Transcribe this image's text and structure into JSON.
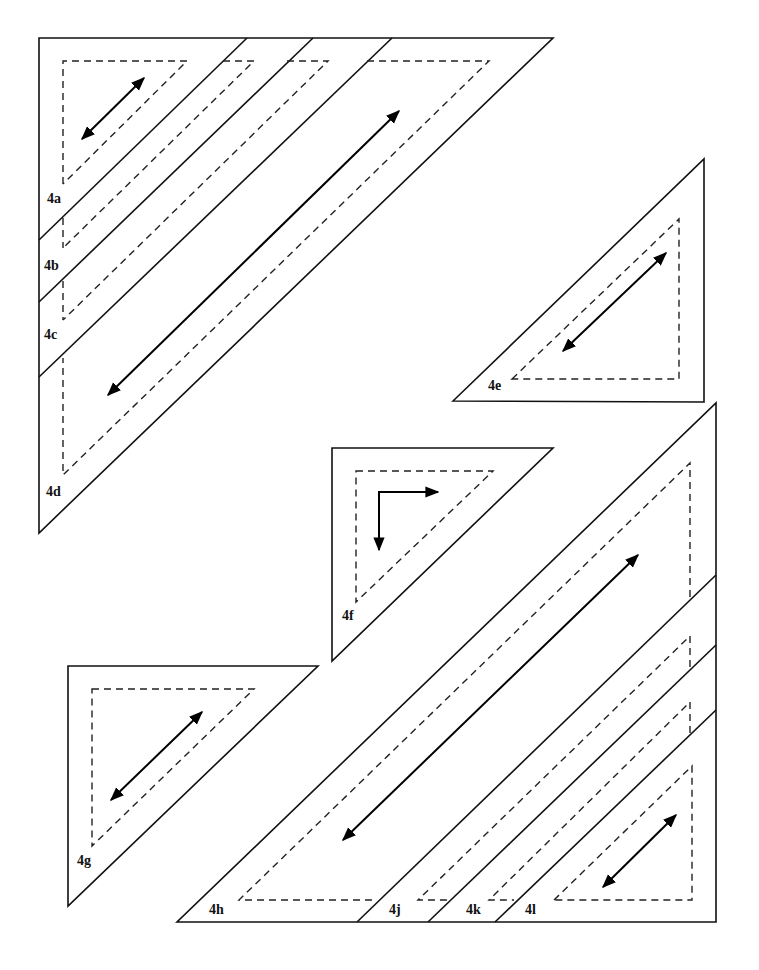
{
  "diagram": {
    "stroke_color": "#111111",
    "background": "#ffffff",
    "pieces": [
      {
        "id": "4a",
        "label": "4a"
      },
      {
        "id": "4b",
        "label": "4b"
      },
      {
        "id": "4c",
        "label": "4c"
      },
      {
        "id": "4d",
        "label": "4d"
      },
      {
        "id": "4e",
        "label": "4e"
      },
      {
        "id": "4f",
        "label": "4f"
      },
      {
        "id": "4g",
        "label": "4g"
      },
      {
        "id": "4h",
        "label": "4h"
      },
      {
        "id": "4j",
        "label": "4j"
      },
      {
        "id": "4k",
        "label": "4k"
      },
      {
        "id": "4l",
        "label": "4l"
      }
    ],
    "legend": {
      "solid_line": "cutting line",
      "dashed_line": "seam line",
      "arrow": "grain direction"
    }
  }
}
